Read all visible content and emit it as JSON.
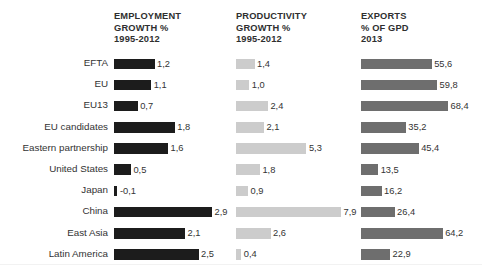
{
  "chart_data": {
    "type": "bar",
    "title": "",
    "subtitle": "",
    "orientation": "horizontal",
    "grid": false,
    "legend_position": "column-headers",
    "xlabel": "",
    "ylabel": "",
    "categories": [
      "EFTA",
      "EU",
      "EU13",
      "EU candidates",
      "Eastern partnership",
      "United States",
      "Japan",
      "China",
      "East Asia",
      "Latin America"
    ],
    "series": [
      {
        "name": "EMPLOYMENT GROWTH % 1995-2012",
        "header_lines": "EMPLOYMENT\nGROWTH %\n1995-2012",
        "color": "#1c1c1c",
        "unit": "%",
        "axis_max": 2.9,
        "values": [
          1.2,
          1.1,
          0.7,
          1.8,
          1.6,
          0.5,
          -0.1,
          2.9,
          2.1,
          2.5
        ],
        "labels": [
          "1,2",
          "1,1",
          "0,7",
          "1,8",
          "1,6",
          "0,5",
          "-0,1",
          "2,9",
          "2,1",
          "2,5"
        ]
      },
      {
        "name": "PRODUCTIVITY GROWTH % 1995-2012",
        "header_lines": "PRODUCTIVITY\nGROWTH %\n1995-2012",
        "color": "#cccccc",
        "unit": "%",
        "axis_max": 7.9,
        "values": [
          1.4,
          1.0,
          2.4,
          2.1,
          5.3,
          1.8,
          0.9,
          7.9,
          2.6,
          0.4
        ],
        "labels": [
          "1,4",
          "1,0",
          "2,4",
          "2,1",
          "5,3",
          "1,8",
          "0,9",
          "7,9",
          "2,6",
          "0,4"
        ]
      },
      {
        "name": "EXPORTS % OF GPD 2013",
        "header_lines": "EXPORTS\n% OF GPD\n2013",
        "color": "#6e6e6e",
        "unit": "% of GDP",
        "axis_max": 68.4,
        "values": [
          55.6,
          59.8,
          68.4,
          35.2,
          45.4,
          13.5,
          16.2,
          26.4,
          64.2,
          22.9
        ],
        "labels": [
          "55,6",
          "59,8",
          "68,4",
          "35,2",
          "45,4",
          "13,5",
          "16,2",
          "26,4",
          "64,2",
          "22,9"
        ]
      }
    ]
  }
}
